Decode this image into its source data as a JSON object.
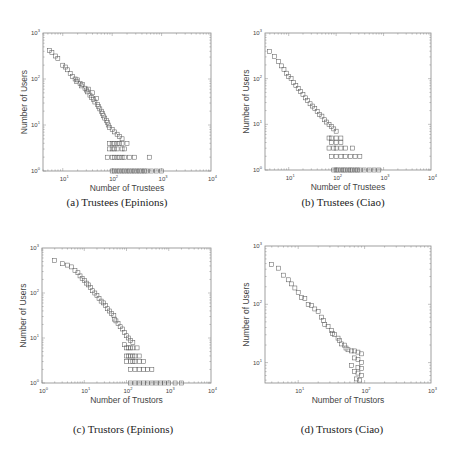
{
  "figure": {
    "captions": [
      "(a)  Trustees (Epinions)",
      "(b)  Trustees (Ciao)",
      "(c)  Trustors (Epinions)",
      "(d)  Trustors (Ciao)"
    ]
  },
  "chart_data": [
    {
      "id": "a",
      "type": "scatter",
      "title": "(a) Trustees (Epinions)",
      "xlabel": "Number of Trustees",
      "ylabel": "Number of Users",
      "xscale": "log",
      "yscale": "log",
      "xlim": [
        0.6,
        4
      ],
      "ylim": [
        0,
        3
      ],
      "xticks": [
        "10^1",
        "10^2",
        "10^3",
        "10^4"
      ],
      "xtick_exp": [
        1,
        2,
        3,
        4
      ],
      "yticks": [
        "10^0",
        "10^1",
        "10^2",
        "10^3"
      ],
      "ytick_exp": [
        0,
        1,
        2,
        3
      ],
      "marker": "square-open",
      "box": {
        "x": 43,
        "y": 33,
        "w": 168,
        "h": 138
      },
      "caption_pos": {
        "x": 117,
        "y": 200
      },
      "points_log10": [
        [
          0.73,
          2.62
        ],
        [
          0.78,
          2.58
        ],
        [
          0.85,
          2.5
        ],
        [
          0.9,
          2.45
        ],
        [
          1.0,
          2.3
        ],
        [
          1.05,
          2.26
        ],
        [
          1.1,
          2.2
        ],
        [
          1.15,
          2.12
        ],
        [
          1.2,
          2.05
        ],
        [
          1.25,
          2.0
        ],
        [
          1.28,
          1.95
        ],
        [
          1.3,
          1.98
        ],
        [
          1.35,
          1.9
        ],
        [
          1.38,
          1.85
        ],
        [
          1.4,
          1.88
        ],
        [
          1.45,
          1.8
        ],
        [
          1.48,
          1.76
        ],
        [
          1.5,
          1.72
        ],
        [
          1.52,
          1.78
        ],
        [
          1.55,
          1.65
        ],
        [
          1.58,
          1.6
        ],
        [
          1.6,
          1.7
        ],
        [
          1.62,
          1.55
        ],
        [
          1.65,
          1.5
        ],
        [
          1.68,
          1.58
        ],
        [
          1.7,
          1.45
        ],
        [
          1.72,
          1.4
        ],
        [
          1.75,
          1.35
        ],
        [
          1.78,
          1.3
        ],
        [
          1.8,
          1.25
        ],
        [
          1.82,
          1.2
        ],
        [
          1.85,
          1.15
        ],
        [
          1.88,
          1.1
        ],
        [
          1.9,
          1.05
        ],
        [
          1.92,
          1.0
        ],
        [
          1.95,
          0.95
        ],
        [
          2.0,
          0.9
        ],
        [
          2.05,
          0.85
        ],
        [
          2.1,
          0.8
        ],
        [
          2.15,
          0.75
        ],
        [
          2.2,
          0.7
        ],
        [
          1.95,
          0.6
        ],
        [
          2.0,
          0.6
        ],
        [
          2.05,
          0.6
        ],
        [
          2.1,
          0.6
        ],
        [
          2.15,
          0.6
        ],
        [
          2.2,
          0.6
        ],
        [
          2.3,
          0.6
        ],
        [
          1.95,
          0.48
        ],
        [
          2.0,
          0.48
        ],
        [
          2.05,
          0.48
        ],
        [
          2.1,
          0.48
        ],
        [
          2.2,
          0.48
        ],
        [
          2.25,
          0.48
        ],
        [
          1.9,
          0.3
        ],
        [
          2.0,
          0.3
        ],
        [
          2.05,
          0.3
        ],
        [
          2.1,
          0.3
        ],
        [
          2.15,
          0.3
        ],
        [
          2.2,
          0.3
        ],
        [
          2.25,
          0.3
        ],
        [
          2.35,
          0.3
        ],
        [
          2.45,
          0.3
        ],
        [
          2.75,
          0.3
        ],
        [
          2.0,
          0
        ],
        [
          2.05,
          0
        ],
        [
          2.1,
          0
        ],
        [
          2.15,
          0
        ],
        [
          2.2,
          0
        ],
        [
          2.25,
          0
        ],
        [
          2.3,
          0
        ],
        [
          2.35,
          0
        ],
        [
          2.4,
          0
        ],
        [
          2.45,
          0
        ],
        [
          2.5,
          0
        ],
        [
          2.55,
          0
        ],
        [
          2.6,
          0
        ],
        [
          2.65,
          0
        ],
        [
          2.7,
          0
        ],
        [
          2.8,
          0
        ],
        [
          2.9,
          0
        ],
        [
          3.0,
          0
        ]
      ]
    },
    {
      "id": "b",
      "type": "scatter",
      "title": "(b) Trustees (Ciao)",
      "xlabel": "Number of Trustees",
      "ylabel": "Number of Users",
      "xscale": "log",
      "yscale": "log",
      "xlim": [
        0.5,
        4
      ],
      "ylim": [
        0,
        3
      ],
      "xticks": [
        "10^1",
        "10^2",
        "10^3",
        "10^4"
      ],
      "xtick_exp": [
        1,
        2,
        3,
        4
      ],
      "yticks": [
        "10^0",
        "10^1",
        "10^2",
        "10^3"
      ],
      "ytick_exp": [
        0,
        1,
        2,
        3
      ],
      "marker": "square-open",
      "box": {
        "x": 265,
        "y": 33,
        "w": 166,
        "h": 137
      },
      "caption_pos": {
        "x": 343,
        "y": 200
      },
      "points_log10": [
        [
          0.6,
          2.6
        ],
        [
          0.7,
          2.48
        ],
        [
          0.78,
          2.38
        ],
        [
          0.85,
          2.28
        ],
        [
          0.9,
          2.2
        ],
        [
          0.95,
          2.12
        ],
        [
          1.0,
          2.05
        ],
        [
          1.05,
          2.0
        ],
        [
          1.1,
          1.92
        ],
        [
          1.15,
          1.85
        ],
        [
          1.2,
          1.78
        ],
        [
          1.25,
          1.72
        ],
        [
          1.3,
          1.65
        ],
        [
          1.35,
          1.58
        ],
        [
          1.4,
          1.52
        ],
        [
          1.45,
          1.45
        ],
        [
          1.5,
          1.4
        ],
        [
          1.55,
          1.35
        ],
        [
          1.6,
          1.28
        ],
        [
          1.65,
          1.22
        ],
        [
          1.7,
          1.18
        ],
        [
          1.75,
          1.1
        ],
        [
          1.8,
          1.05
        ],
        [
          1.85,
          1.0
        ],
        [
          1.9,
          0.95
        ],
        [
          1.95,
          0.9
        ],
        [
          2.0,
          0.85
        ],
        [
          1.85,
          0.7
        ],
        [
          1.9,
          0.7
        ],
        [
          2.0,
          0.7
        ],
        [
          2.1,
          0.7
        ],
        [
          1.9,
          0.6
        ],
        [
          2.0,
          0.6
        ],
        [
          2.1,
          0.6
        ],
        [
          1.85,
          0.48
        ],
        [
          1.95,
          0.48
        ],
        [
          2.0,
          0.48
        ],
        [
          2.1,
          0.48
        ],
        [
          2.2,
          0.48
        ],
        [
          2.35,
          0.48
        ],
        [
          1.9,
          0.3
        ],
        [
          2.0,
          0.3
        ],
        [
          2.1,
          0.3
        ],
        [
          2.2,
          0.3
        ],
        [
          2.3,
          0.3
        ],
        [
          2.4,
          0.3
        ],
        [
          2.5,
          0.3
        ],
        [
          1.95,
          0
        ],
        [
          2.0,
          0
        ],
        [
          2.05,
          0
        ],
        [
          2.1,
          0
        ],
        [
          2.15,
          0
        ],
        [
          2.2,
          0
        ],
        [
          2.25,
          0
        ],
        [
          2.3,
          0
        ],
        [
          2.35,
          0
        ],
        [
          2.4,
          0
        ],
        [
          2.45,
          0
        ],
        [
          2.5,
          0
        ],
        [
          2.6,
          0
        ],
        [
          2.7,
          0
        ],
        [
          2.8,
          0
        ],
        [
          2.9,
          0
        ]
      ]
    },
    {
      "id": "c",
      "type": "scatter",
      "title": "(c) Trustors (Epinions)",
      "xlabel": "Number of Trustors",
      "ylabel": "Number of Users",
      "xscale": "log",
      "yscale": "log",
      "xlim": [
        0,
        4
      ],
      "ylim": [
        0,
        3
      ],
      "xticks": [
        "10^0",
        "10^1",
        "10^2",
        "10^3",
        "10^4"
      ],
      "xtick_exp": [
        0,
        1,
        2,
        3,
        4
      ],
      "yticks": [
        "10^0",
        "10^1",
        "10^2",
        "10^3"
      ],
      "ytick_exp": [
        0,
        1,
        2,
        3
      ],
      "marker": "square-open",
      "box": {
        "x": 42,
        "y": 248,
        "w": 169,
        "h": 135
      },
      "caption_pos": {
        "x": 123,
        "y": 428
      },
      "points_log10": [
        [
          0.3,
          2.72
        ],
        [
          0.48,
          2.65
        ],
        [
          0.6,
          2.62
        ],
        [
          0.7,
          2.58
        ],
        [
          0.78,
          2.5
        ],
        [
          0.85,
          2.45
        ],
        [
          0.9,
          2.38
        ],
        [
          0.95,
          2.32
        ],
        [
          1.0,
          2.28
        ],
        [
          1.05,
          2.22
        ],
        [
          1.1,
          2.18
        ],
        [
          1.15,
          2.12
        ],
        [
          1.2,
          2.05
        ],
        [
          1.25,
          2.0
        ],
        [
          1.3,
          1.95
        ],
        [
          1.35,
          1.88
        ],
        [
          1.4,
          1.82
        ],
        [
          1.45,
          1.78
        ],
        [
          1.5,
          1.72
        ],
        [
          1.55,
          1.65
        ],
        [
          1.6,
          1.6
        ],
        [
          1.65,
          1.55
        ],
        [
          1.7,
          1.5
        ],
        [
          1.72,
          1.42
        ],
        [
          1.75,
          1.38
        ],
        [
          1.8,
          1.32
        ],
        [
          1.85,
          1.25
        ],
        [
          1.9,
          1.2
        ],
        [
          1.95,
          1.12
        ],
        [
          2.0,
          1.05
        ],
        [
          2.05,
          1.0
        ],
        [
          2.1,
          0.95
        ],
        [
          2.15,
          0.9
        ],
        [
          1.95,
          0.85
        ],
        [
          2.0,
          0.78
        ],
        [
          2.05,
          0.78
        ],
        [
          2.1,
          0.78
        ],
        [
          2.15,
          0.78
        ],
        [
          2.25,
          0.78
        ],
        [
          2.0,
          0.6
        ],
        [
          2.05,
          0.6
        ],
        [
          2.1,
          0.6
        ],
        [
          2.15,
          0.6
        ],
        [
          2.2,
          0.6
        ],
        [
          2.3,
          0.6
        ],
        [
          2.0,
          0.48
        ],
        [
          2.1,
          0.48
        ],
        [
          2.15,
          0.48
        ],
        [
          2.2,
          0.48
        ],
        [
          2.3,
          0.48
        ],
        [
          2.4,
          0.48
        ],
        [
          2.1,
          0.3
        ],
        [
          2.2,
          0.3
        ],
        [
          2.3,
          0.3
        ],
        [
          2.4,
          0.3
        ],
        [
          2.5,
          0.3
        ],
        [
          2.6,
          0.3
        ],
        [
          2.1,
          0
        ],
        [
          2.2,
          0
        ],
        [
          2.3,
          0
        ],
        [
          2.4,
          0
        ],
        [
          2.5,
          0
        ],
        [
          2.6,
          0
        ],
        [
          2.7,
          0
        ],
        [
          2.8,
          0
        ],
        [
          2.9,
          0
        ],
        [
          3.0,
          0
        ],
        [
          3.15,
          0
        ],
        [
          3.3,
          0
        ]
      ]
    },
    {
      "id": "d",
      "type": "scatter",
      "title": "(d) Trustors (Ciao)",
      "xlabel": "Number of Trustors",
      "ylabel": "Number of Users",
      "xscale": "log",
      "yscale": "log",
      "xlim": [
        0.5,
        3
      ],
      "ylim": [
        0.65,
        3
      ],
      "xticks": [
        "10^1",
        "10^2",
        "10^3"
      ],
      "xtick_exp": [
        1,
        2,
        3
      ],
      "yticks": [
        "10^1",
        "10^2",
        "10^3"
      ],
      "ytick_exp": [
        1,
        2,
        3
      ],
      "marker": "square-open",
      "box": {
        "x": 265,
        "y": 246,
        "w": 166,
        "h": 137
      },
      "caption_pos": {
        "x": 342,
        "y": 428
      },
      "points_log10": [
        [
          0.6,
          2.68
        ],
        [
          0.7,
          2.62
        ],
        [
          0.78,
          2.5
        ],
        [
          0.85,
          2.42
        ],
        [
          0.9,
          2.35
        ],
        [
          0.95,
          2.28
        ],
        [
          1.0,
          2.2
        ],
        [
          1.05,
          2.12
        ],
        [
          1.1,
          2.1
        ],
        [
          1.15,
          2.0
        ],
        [
          1.2,
          1.98
        ],
        [
          1.25,
          1.92
        ],
        [
          1.3,
          1.88
        ],
        [
          1.35,
          1.78
        ],
        [
          1.38,
          1.72
        ],
        [
          1.4,
          1.65
        ],
        [
          1.45,
          1.62
        ],
        [
          1.5,
          1.55
        ],
        [
          1.52,
          1.5
        ],
        [
          1.55,
          1.48
        ],
        [
          1.6,
          1.42
        ],
        [
          1.62,
          1.38
        ],
        [
          1.65,
          1.32
        ],
        [
          1.7,
          1.3
        ],
        [
          1.72,
          1.25
        ],
        [
          1.75,
          1.22
        ],
        [
          1.8,
          1.2
        ],
        [
          1.85,
          1.2
        ],
        [
          1.9,
          1.18
        ],
        [
          1.95,
          1.15
        ],
        [
          1.85,
          1.08
        ],
        [
          1.9,
          1.05
        ],
        [
          1.95,
          1.0
        ],
        [
          1.8,
          0.95
        ],
        [
          1.9,
          0.92
        ],
        [
          1.95,
          0.9
        ],
        [
          1.85,
          0.85
        ],
        [
          1.9,
          0.82
        ],
        [
          1.95,
          0.78
        ],
        [
          1.88,
          0.72
        ],
        [
          1.92,
          0.7
        ]
      ]
    }
  ]
}
